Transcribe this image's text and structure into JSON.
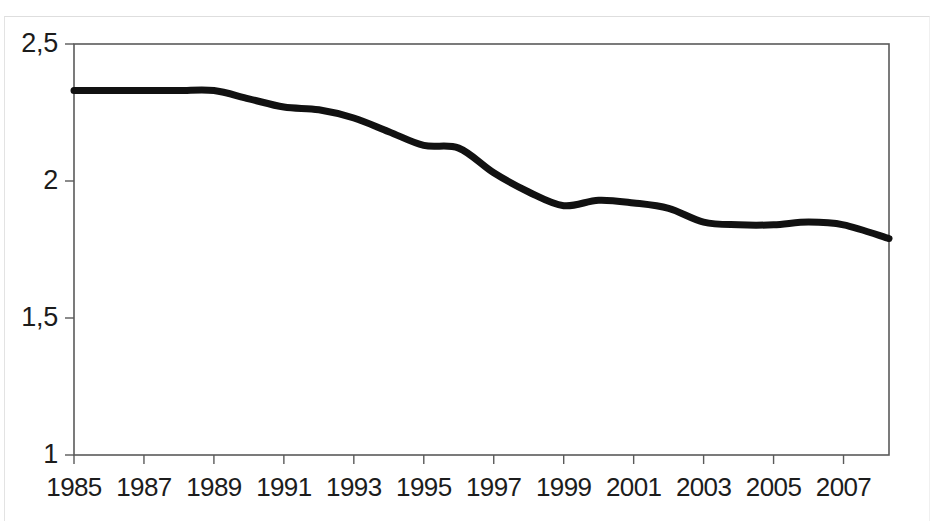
{
  "chart_data": {
    "type": "line",
    "title": "",
    "subtitle": "",
    "xlabel": "",
    "ylabel": "",
    "grid": false,
    "legend": null,
    "decimal_separator": ",",
    "line_color": "#111111",
    "line_width": 7,
    "xlim": [
      1985,
      2008.3
    ],
    "ylim": [
      1,
      2.5
    ],
    "yticks": [
      1,
      1.5,
      2,
      2.5
    ],
    "ytick_labels": [
      "1",
      "1,5",
      "2",
      "2,5"
    ],
    "xticks": [
      1985,
      1987,
      1989,
      1991,
      1993,
      1995,
      1997,
      1999,
      2001,
      2003,
      2005,
      2007
    ],
    "xtick_labels": [
      "1985",
      "1987",
      "1989",
      "1991",
      "1993",
      "1995",
      "1997",
      "1999",
      "2001",
      "2003",
      "2005",
      "2007"
    ],
    "series": [
      {
        "name": "",
        "x": [
          1985,
          1986,
          1987,
          1988,
          1989,
          1990,
          1991,
          1992,
          1993,
          1994,
          1995,
          1996,
          1997,
          1998,
          1999,
          2000,
          2001,
          2002,
          2003,
          2004,
          2005,
          2006,
          2007,
          2008.3
        ],
        "values": [
          2.33,
          2.33,
          2.33,
          2.33,
          2.33,
          2.3,
          2.27,
          2.26,
          2.23,
          2.18,
          2.13,
          2.12,
          2.03,
          1.96,
          1.91,
          1.93,
          1.92,
          1.9,
          1.85,
          1.84,
          1.84,
          1.85,
          1.84,
          1.79
        ]
      }
    ]
  }
}
